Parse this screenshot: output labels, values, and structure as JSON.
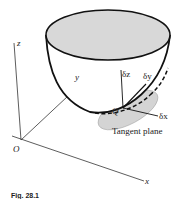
{
  "figure": {
    "caption": "Fig. 28.1",
    "axes": {
      "x": "x",
      "y": "y",
      "z": "z",
      "origin": "O"
    },
    "point_label": "Q",
    "increments": {
      "dx": "δx",
      "dy": "δy",
      "dz": "δz"
    },
    "tangent_plane_label": "Tangent plane",
    "colors": {
      "surface_fill": "#d8d8d8",
      "plane_fill": "#d4d4d4",
      "line": "#111111"
    }
  }
}
